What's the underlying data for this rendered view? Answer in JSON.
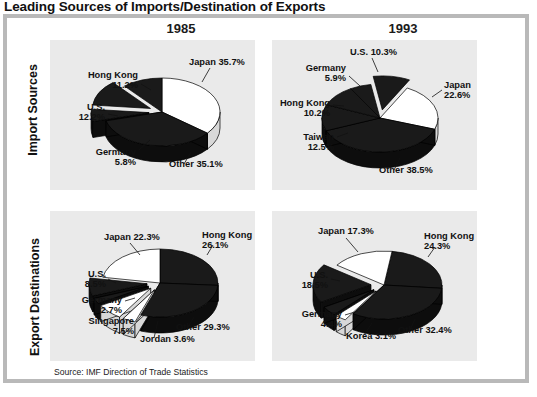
{
  "figure": {
    "title": "Leading Sources of Imports/Destination of Exports",
    "source_note": "Source: IMF Direction of Trade Statistics",
    "column_headers": [
      "1985",
      "1993"
    ],
    "row_labels": [
      "Import Sources",
      "Export Destinations"
    ],
    "colors": {
      "dark_slice": "#1a1a1a",
      "light_slice": "#ffffff",
      "panel_background": "#eaeaea",
      "frame_border": "#b9b9b9",
      "text": "#111111"
    }
  },
  "chart_data": [
    {
      "type": "pie",
      "title": "Import Sources 1985",
      "row": "Import Sources",
      "year": "1985",
      "categories": [
        "Japan",
        "Other",
        "Germany",
        "U.S.",
        "Hong Kong"
      ],
      "values": [
        35.7,
        35.1,
        5.8,
        12.2,
        11.2
      ],
      "labels": [
        "Japan 35.7%",
        "Other 35.1%",
        "Germany\n5.8%",
        "U.S.\n12.2%",
        "Hong Kong\n11.2%"
      ],
      "colors": [
        "#ffffff",
        "#1a1a1a",
        "#1a1a1a",
        "#1a1a1a",
        "#1a1a1a"
      ],
      "exploded": [
        false,
        false,
        true,
        true,
        false
      ],
      "unit": "percent"
    },
    {
      "type": "pie",
      "title": "Import Sources 1993",
      "row": "Import Sources",
      "year": "1993",
      "categories": [
        "Japan",
        "Other",
        "Taiwan",
        "Hong Kong",
        "Germany",
        "U.S."
      ],
      "values": [
        22.6,
        38.5,
        12.5,
        10.2,
        5.9,
        10.3
      ],
      "labels": [
        "Japan\n22.6%",
        "Other 38.5%",
        "Taiwan\n12.5%",
        "Hong Kong\n10.2%",
        "Germany\n5.9%",
        "U.S. 10.3%"
      ],
      "colors": [
        "#ffffff",
        "#1a1a1a",
        "#1a1a1a",
        "#1a1a1a",
        "#1a1a1a",
        "#1a1a1a"
      ],
      "exploded": [
        false,
        false,
        false,
        false,
        false,
        true
      ],
      "unit": "percent"
    },
    {
      "type": "pie",
      "title": "Export Destinations 1985",
      "row": "Export Destinations",
      "year": "1985",
      "categories": [
        "Hong Kong",
        "Other",
        "Jordan",
        "Singapore",
        "Germany",
        "U.S.",
        "Japan"
      ],
      "values": [
        26.1,
        29.3,
        3.6,
        7.5,
        2.7,
        8.5,
        22.3
      ],
      "labels": [
        "Hong Kong\n26.1%",
        "Other 29.3%",
        "Jordan 3.6%",
        "Singapore\n7.5%",
        "Germany\n2.7%",
        "U.S.\n8.5%",
        "Japan 22.3%"
      ],
      "colors": [
        "#1a1a1a",
        "#1a1a1a",
        "#ffffff",
        "#ffffff",
        "#1a1a1a",
        "#1a1a1a",
        "#ffffff"
      ],
      "exploded": [
        false,
        false,
        true,
        true,
        true,
        true,
        false
      ],
      "unit": "percent"
    },
    {
      "type": "pie",
      "title": "Export Destinations 1993",
      "row": "Export Destinations",
      "year": "1993",
      "categories": [
        "Hong Kong",
        "Other",
        "Korea",
        "Germany",
        "U.S.",
        "Japan"
      ],
      "values": [
        24.3,
        32.4,
        3.1,
        4.4,
        18.5,
        17.3
      ],
      "labels": [
        "Hong Kong\n24.3%",
        "Other 32.4%",
        "Korea 3.1%",
        "Germany\n4.4%",
        "U.S.\n18.5%",
        "Japan 17.3%"
      ],
      "colors": [
        "#1a1a1a",
        "#1a1a1a",
        "#ffffff",
        "#1a1a1a",
        "#1a1a1a",
        "#ffffff"
      ],
      "exploded": [
        false,
        false,
        true,
        true,
        true,
        false
      ],
      "unit": "percent"
    }
  ]
}
